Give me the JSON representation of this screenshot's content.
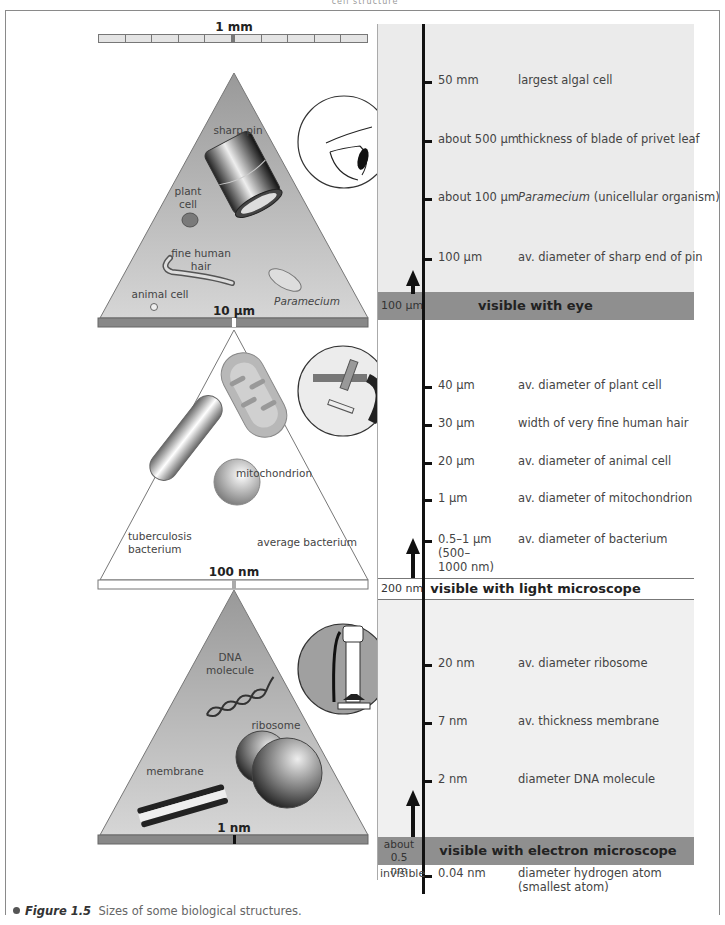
{
  "header": {
    "cut_text": "cell structure"
  },
  "caption": {
    "label": "Figure 1.5",
    "text": "Sizes of some biological structures."
  },
  "colors": {
    "band_dark": "#8f8f8f",
    "panel_top": "#ebebeb",
    "panel_bottom": "#f0f0f0",
    "triangle_dark": "#a8a8a8",
    "axis": "#111111"
  },
  "triangles": [
    {
      "scale_top": "1 mm",
      "scale_bottom": "10 µm",
      "labels": [
        "sharp pin",
        "plant cell",
        "fine human hair",
        "animal cell",
        "Paramecium"
      ],
      "icon": "eye-icon"
    },
    {
      "scale_bottom": "100 nm",
      "labels": [
        "mitochondrion",
        "tuberculosis bacterium",
        "average bacterium"
      ],
      "icon": "light-microscope-icon"
    },
    {
      "scale_bottom": "1 nm",
      "labels": [
        "DNA molecule",
        "ribosome",
        "membrane"
      ],
      "icon": "electron-microscope-icon"
    }
  ],
  "scale": {
    "entries": [
      {
        "value": "50 mm",
        "desc": "largest algal cell"
      },
      {
        "value": "about 500 µm",
        "desc": "thickness of blade of privet leaf"
      },
      {
        "value": "about 100 µm",
        "desc_italic": "Paramecium",
        "desc": " (unicellular organism)"
      },
      {
        "value": "100 µm",
        "desc": "av. diameter of sharp end of pin"
      },
      {
        "value": "40 µm",
        "desc": "av. diameter of plant cell"
      },
      {
        "value": "30 µm",
        "desc": "width of very fine human hair"
      },
      {
        "value": "20 µm",
        "desc": "av. diameter of animal cell"
      },
      {
        "value": "1 µm",
        "desc": "av. diameter of mitochondrion"
      },
      {
        "value_lines": [
          "0.5–1 µm",
          "(500–",
          "1000 nm)"
        ],
        "desc": "av. diameter of bacterium"
      },
      {
        "value": "20 nm",
        "desc": "av. diameter ribosome"
      },
      {
        "value": "7 nm",
        "desc": "av. thickness membrane"
      },
      {
        "value": "2 nm",
        "desc": "diameter DNA molecule"
      },
      {
        "value": "0.04 nm",
        "desc_lines": [
          "diameter hydrogen atom",
          "(smallest atom)"
        ]
      }
    ],
    "bands": [
      {
        "limit": "100 µm",
        "label": "visible with eye"
      },
      {
        "limit": "200 nm",
        "label": "visible with light microscope"
      },
      {
        "limit_lines": [
          "about",
          "0.5 nm"
        ],
        "label": "visible with electron microscope"
      }
    ],
    "invisible_label": "invisible"
  }
}
